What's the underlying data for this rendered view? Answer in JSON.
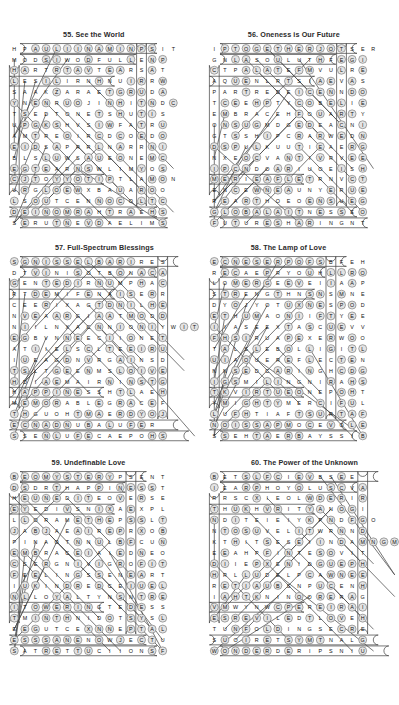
{
  "page": {
    "kind": "word-search-puzzle-page",
    "layout": {
      "columns": 2,
      "rows": 3
    },
    "background_color": "#ffffff",
    "letter_circle_color": "#e3e3e3",
    "solution_line_color": "#4a4a4a"
  },
  "puzzles": [
    {
      "id": "p55",
      "number": "55.",
      "title": "55. See the World",
      "name": "See the World",
      "cols": 17,
      "rows": 17,
      "grid": [
        "HPAULIINAMINPSIT",
        "MODSIWODFULLENP",
        "HARTRTAVTEARSAT",
        "LESILIRNHNUIRRW",
        "SAAKZARAETGRUDA",
        "YNENRUOJINHITNDC",
        "TSEDTONETSHUTIS",
        "UPGKSHVSIWFATRU",
        "AMTREOIRCDCOEDO",
        "EIDSAPRRLNARRNI",
        "BLSLUWSAUEONEMC",
        "EGTEARNSWLIMYOS",
        "CJTOYYOTIPTLAMON",
        "URGLOEWXBAUAROO",
        "LSOUTCENNOCOLTC",
        "DEINOMRAHTRAEHS",
        "SERUTNEVDAELIMS"
      ]
    },
    {
      "id": "p56",
      "number": "56.",
      "title": "56. Oneness is Our Future",
      "name": "Oneness is Our Future",
      "cols": 17,
      "rows": 17,
      "grid": [
        "IPTOGETHERJOTSER",
        "GNLASOULUTHFEGI",
        "CTPALATEFMVULRE",
        "AQUENLRTSIAEVAS",
        "PARTREDEICENNDO",
        "TCEEHPTYCOBELIE",
        "EMBRACEHFOUARTY",
        "ONSUGMDGEDEACNI",
        "GTSSHIPCRARWEDN",
        "DSPULKUUTIEAERG",
        "NXEOCVANTIVRVEE",
        "IPCNDOARIUOEISH",
        "MERIEAFLETRNVCT",
        "ENCEWNEAUNYERUE",
        "REARTHOEOENSUEG",
        "GLOBALAITNESSEO",
        "FUTURESHARINGNT"
      ]
    },
    {
      "id": "p57",
      "number": "57.",
      "title": "57. Full-Spectrum Blessings",
      "name": "Full-Spectrum Blessings",
      "cols": 17,
      "rows": 17,
      "grid": [
        "SGNISSELBARIRES",
        "DTVINISOTBONACA",
        "GENTEDIRNUMPHAC",
        "RTDEMIFENAISERR",
        "CEERIXAGTDNILHE",
        "NVEAARGIAATMODD",
        "NIILNXACNNIONIYWIT",
        "EGBVNNEECIIONET",
        "ATIIELSCLTEEIRU",
        "IUEAGDNVRGAINSD",
        "TSLTGEENMSLOIVE",
        "HDIAEMAIRNINSTG",
        "HAPPINESSHTLAEH",
        "MEMORABLEGRACEF",
        "THGUOHTMAERDYOJ",
        "ECNADNUBALUFER",
        "SSENLUFECAEPOHS"
      ]
    },
    {
      "id": "p58",
      "number": "58.",
      "title": "58. The Lamp of Love",
      "name": "The Lamp of Love",
      "cols": 17,
      "rows": 17,
      "grid": [
        "ECNESERPOFSBFEH",
        "RECAEPRYOUHLLRO",
        "LOMERGEEVEIIAAP",
        "STRENGTHNSNSMNE",
        "DYOJYOTUXNESPOD",
        "ETHUMAONIIFTYEE",
        "IIASEEXTASCUEVV",
        "FHSIRUAPEXERWOO",
        "TALSLEBOLLIGITL",
        "UIAOUEREFLECTEN",
        "NNSEDCARINGHCDG",
        "IGSMILINGNIRAHS",
        "TKVIRTUEONEPOHT",
        "YMIGHTYMERCIFUL",
        "LUFHTIAFTSURTAF",
        "NOISSAPMOCEVOLE",
        "SSEHTAERBAYSSIB"
      ]
    },
    {
      "id": "p59",
      "number": "59.",
      "title": "59. Undefinable Love",
      "name": "Undefinable Love",
      "cols": 17,
      "rows": 17,
      "grid": [
        "BEOMYSTERYPSENT",
        "DSDRTHAPPINESST",
        "HEUNEDITEOVERSE",
        "EYEDIVSNIXAEXPL",
        "LLORAMETHEPSSLT",
        "JABJAEAIREPRXOB",
        "PINAOTNNULBFCUN",
        "EMBRACEIAIEDNEO",
        "CSERGNIVIGROFIT",
        "FEELINGSSENEART",
        "IUKINDREDCEIUEL",
        "NLLOYALTYNSNTRE",
        "ITOWERINGTEDESS",
        "TMINTHNIDOTSYSL",
        "EEGUTCEXNNEPTAL",
        "ESSSANENOWJECTU",
        "SATRETTUCIIONSF"
      ]
    },
    {
      "id": "p60",
      "number": "60.",
      "title": "60. The Power of the Unknown",
      "name": "The Power of the Unknown",
      "cols": 17,
      "rows": 17,
      "grid": [
        "BETSLFCIEVBSEE",
        "IEARPHOYOLUSCVA",
        "RRSCXIEOLWDERIR",
        "THUKHVRITYANOGI",
        "NDITEIEIYKPNDFGO",
        "NTOSUVELITWRNND",
        "KTHITSESEIINDAMNGM",
        "EEAHPFINTESOVIT",
        "DIIEPXENIDGUEPH",
        "HRLLUDELPCAWNEE",
        "RETIAUBSNPUCENH",
        "IAHTKNINOORERAG",
        "VMWYNWCPEREIRAI",
        "ESREVILEDTLOVEH",
        "TUNFOLDINGSECRE",
        "SUOIRETSYMTNALG",
        "WONDERDERIPSNIU"
      ]
    }
  ]
}
